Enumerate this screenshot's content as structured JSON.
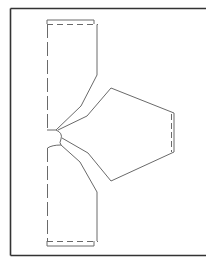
{
  "diagram": {
    "title": "",
    "colors": {
      "background": "#ffffff",
      "frame": "#333333",
      "pattern_line": "#6a6a6a"
    },
    "pieces": [
      {
        "name": "top-panel",
        "label": ""
      },
      {
        "name": "bottom-panel",
        "label": ""
      },
      {
        "name": "sleeve-piece",
        "label": ""
      }
    ]
  }
}
